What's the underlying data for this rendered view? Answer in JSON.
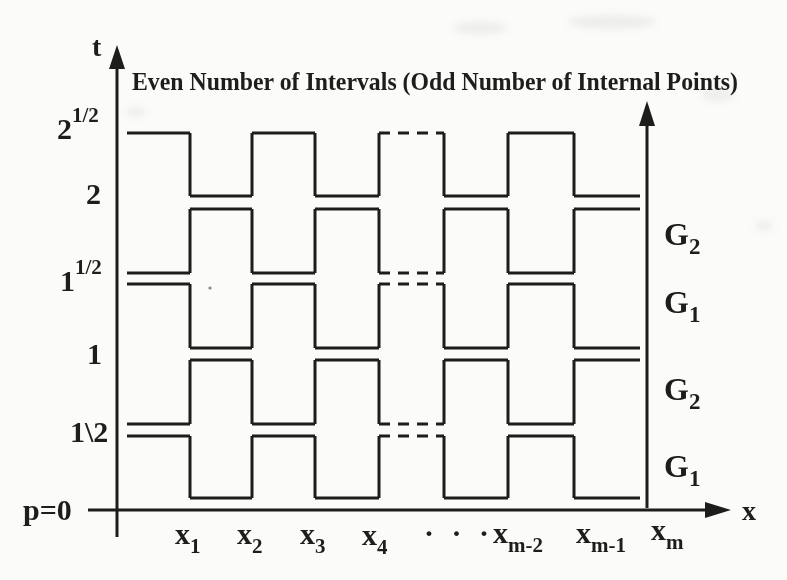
{
  "title": "Even Number of Intervals (Odd Number of Internal Points)",
  "axes": {
    "t_axis_label": "t",
    "x_axis_label": "x",
    "origin_label": "p=0"
  },
  "t_ticks": [
    {
      "base": "2",
      "sup": "1/2"
    },
    {
      "base": "2",
      "sup": ""
    },
    {
      "base": "1",
      "sup": "1/2"
    },
    {
      "base": "1",
      "sup": ""
    },
    {
      "base": "1\\2",
      "sup": ""
    }
  ],
  "x_ticks": [
    {
      "base": "x",
      "sub": "1"
    },
    {
      "base": "x",
      "sub": "2"
    },
    {
      "base": "x",
      "sub": "3"
    },
    {
      "base": "x",
      "sub": "4"
    },
    {
      "base": "· · ·",
      "sub": ""
    },
    {
      "base": "x",
      "sub": "m-2"
    },
    {
      "base": "x",
      "sub": "m-1"
    },
    {
      "base": "x",
      "sub": "m"
    }
  ],
  "group_labels": [
    {
      "base": "G",
      "sub": "2"
    },
    {
      "base": "G",
      "sub": "1"
    },
    {
      "base": "G",
      "sub": "2"
    },
    {
      "base": "G",
      "sub": "1"
    }
  ],
  "ink_color": "#1d1d1b",
  "paper_color": "#fbfbf9",
  "chart_data": {
    "type": "diagram",
    "title": "Even Number of Intervals (Odd Number of Internal Points)",
    "t_tick_labels_bottom_to_top": [
      "p=0",
      "1\\2",
      "1",
      "1 1/2",
      "2",
      "2 1/2"
    ],
    "x_tick_labels_left_to_right": [
      "x1",
      "x2",
      "x3",
      "x4",
      "···",
      "xm-2",
      "xm-1",
      "xm"
    ],
    "right_band_labels_top_to_bottom": [
      "G2",
      "G1",
      "G2",
      "G1"
    ],
    "x_boundaries_px": [
      127,
      190,
      252,
      315,
      379,
      444,
      508,
      574,
      640
    ],
    "dashed_segment_interval_index": 4,
    "bands_top_to_bottom": [
      {
        "t_low_label": "2",
        "t_high_label": "2 1/2",
        "group": null,
        "high_y_px": 133,
        "low_y_px": 196,
        "high_intervals": "even"
      },
      {
        "t_low_label": "1 1/2",
        "t_high_label": "2",
        "group": "G2",
        "high_y_px": 209,
        "low_y_px": 273,
        "high_intervals": "odd"
      },
      {
        "t_low_label": "1",
        "t_high_label": "1 1/2",
        "group": "G1",
        "high_y_px": 284,
        "low_y_px": 348,
        "high_intervals": "even"
      },
      {
        "t_low_label": "1/2",
        "t_high_label": "1",
        "group": "G2",
        "high_y_px": 360,
        "low_y_px": 424,
        "high_intervals": "odd"
      },
      {
        "t_low_label": "0",
        "t_high_label": "1/2",
        "group": "G1",
        "high_y_px": 436,
        "low_y_px": 498,
        "high_intervals": "even"
      }
    ]
  }
}
